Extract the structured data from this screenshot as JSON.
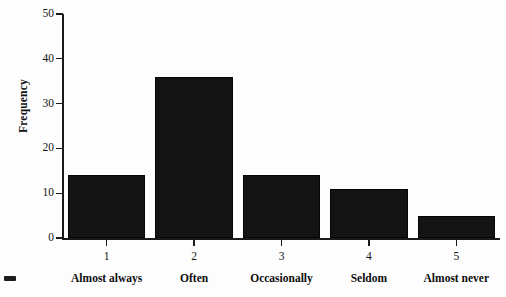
{
  "chart_data": {
    "type": "bar",
    "title": "",
    "xlabel": "",
    "ylabel": "Frequency",
    "ylim": [
      0,
      50
    ],
    "ytick_step": 10,
    "yticks": [
      "0",
      "10",
      "20",
      "30",
      "40",
      "50"
    ],
    "grid": false,
    "legend": "none",
    "categories": [
      "1",
      "2",
      "3",
      "4",
      "5"
    ],
    "category_labels": [
      "Almost always",
      "Often",
      "Occasionally",
      "Seldom",
      "Almost never"
    ],
    "values": [
      14,
      36,
      14,
      11,
      5
    ],
    "bar_color": "#141414",
    "axis_color": "#1a1a1a",
    "background_color": "#fdfdfd"
  },
  "figure": {
    "y_axis_title": "Frequency",
    "artifact_label": "scan-mark"
  }
}
